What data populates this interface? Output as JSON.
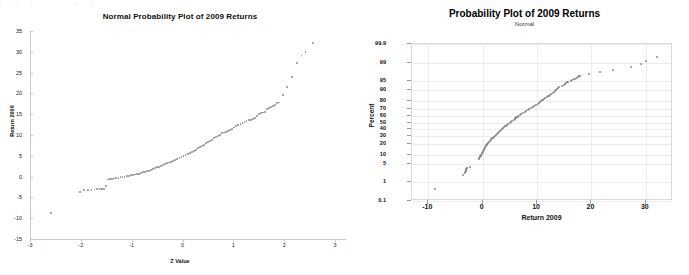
{
  "left_chart": {
    "title": "Normal Probability Plot of 2009 Returns",
    "xlabel": "Z Value",
    "ylabel": "Return 2009"
  },
  "right_chart": {
    "title": "Probability Plot of 2009 Returns",
    "subtitle": "Normal",
    "xlabel": "Return 2009",
    "ylabel": "Percent"
  },
  "artifact": {
    "text": "| | | , , | |"
  },
  "chart_data": [
    {
      "type": "scatter",
      "title": "Normal Probability Plot of 2009 Returns",
      "subtitle": "",
      "xlabel": "Z Value",
      "ylabel": "Return 2009",
      "xlim": [
        -3,
        3
      ],
      "ylim": [
        -15,
        35
      ],
      "xticks": [
        -3,
        -2,
        -1,
        0,
        1,
        2,
        3
      ],
      "yticks": [
        -15,
        -10,
        -5,
        0,
        5,
        10,
        15,
        20,
        25,
        30,
        35
      ],
      "grid": false,
      "legend": null,
      "marker_color": "#8a8a8a",
      "points": [
        [
          -2.58,
          -8.8
        ],
        [
          -2.02,
          -3.6
        ],
        [
          -1.93,
          -3.3
        ],
        [
          -1.86,
          -3.2
        ],
        [
          -1.79,
          -3.15
        ],
        [
          -1.73,
          -3.1
        ],
        [
          -1.68,
          -3.05
        ],
        [
          -1.63,
          -3.0
        ],
        [
          -1.58,
          -2.95
        ],
        [
          -1.54,
          -2.9
        ],
        [
          -1.5,
          -2.3
        ],
        [
          -1.46,
          -0.7
        ],
        [
          -1.42,
          -0.6
        ],
        [
          -1.38,
          -0.5
        ],
        [
          -1.34,
          -0.45
        ],
        [
          -1.3,
          -0.4
        ],
        [
          -1.26,
          -0.3
        ],
        [
          -1.22,
          -0.2
        ],
        [
          -1.18,
          -0.1
        ],
        [
          -1.14,
          0.0
        ],
        [
          -1.1,
          0.1
        ],
        [
          -1.06,
          0.2
        ],
        [
          -1.02,
          0.3
        ],
        [
          -0.98,
          0.4
        ],
        [
          -0.94,
          0.5
        ],
        [
          -0.9,
          0.6
        ],
        [
          -0.86,
          0.7
        ],
        [
          -0.82,
          0.85
        ],
        [
          -0.78,
          1.0
        ],
        [
          -0.74,
          1.15
        ],
        [
          -0.7,
          1.3
        ],
        [
          -0.66,
          1.45
        ],
        [
          -0.62,
          1.6
        ],
        [
          -0.58,
          1.8
        ],
        [
          -0.54,
          2.0
        ],
        [
          -0.5,
          2.2
        ],
        [
          -0.46,
          2.4
        ],
        [
          -0.42,
          2.6
        ],
        [
          -0.38,
          2.8
        ],
        [
          -0.34,
          3.0
        ],
        [
          -0.3,
          3.2
        ],
        [
          -0.26,
          3.4
        ],
        [
          -0.22,
          3.6
        ],
        [
          -0.18,
          3.8
        ],
        [
          -0.14,
          4.0
        ],
        [
          -0.1,
          4.2
        ],
        [
          -0.06,
          4.45
        ],
        [
          -0.02,
          4.7
        ],
        [
          0.02,
          4.95
        ],
        [
          0.06,
          5.2
        ],
        [
          0.1,
          5.45
        ],
        [
          0.14,
          5.7
        ],
        [
          0.18,
          5.95
        ],
        [
          0.22,
          6.2
        ],
        [
          0.26,
          6.5
        ],
        [
          0.3,
          6.8
        ],
        [
          0.34,
          7.1
        ],
        [
          0.38,
          7.4
        ],
        [
          0.42,
          7.7
        ],
        [
          0.46,
          8.0
        ],
        [
          0.5,
          8.3
        ],
        [
          0.54,
          8.6
        ],
        [
          0.58,
          8.9
        ],
        [
          0.62,
          9.2
        ],
        [
          0.66,
          9.5
        ],
        [
          0.7,
          9.8
        ],
        [
          0.74,
          10.1
        ],
        [
          0.78,
          10.4
        ],
        [
          0.82,
          10.6
        ],
        [
          0.86,
          10.8
        ],
        [
          0.9,
          11.0
        ],
        [
          0.94,
          11.2
        ],
        [
          0.98,
          11.5
        ],
        [
          1.02,
          11.8
        ],
        [
          1.06,
          12.1
        ],
        [
          1.1,
          12.35
        ],
        [
          1.14,
          12.6
        ],
        [
          1.18,
          12.85
        ],
        [
          1.22,
          13.1
        ],
        [
          1.26,
          13.3
        ],
        [
          1.3,
          13.5
        ],
        [
          1.34,
          13.7
        ],
        [
          1.38,
          13.9
        ],
        [
          1.42,
          14.1
        ],
        [
          1.46,
          14.6
        ],
        [
          1.5,
          15.0
        ],
        [
          1.54,
          15.2
        ],
        [
          1.58,
          15.4
        ],
        [
          1.62,
          15.6
        ],
        [
          1.66,
          16.2
        ],
        [
          1.7,
          16.5
        ],
        [
          1.74,
          16.8
        ],
        [
          1.78,
          17.0
        ],
        [
          1.82,
          17.3
        ],
        [
          1.86,
          17.6
        ],
        [
          1.9,
          17.8
        ],
        [
          1.98,
          19.6
        ],
        [
          2.06,
          21.6
        ],
        [
          2.15,
          23.9
        ],
        [
          2.26,
          27.2
        ],
        [
          2.34,
          29.1
        ],
        [
          2.42,
          30.0
        ],
        [
          2.56,
          32.1
        ]
      ]
    },
    {
      "type": "scatter",
      "title": "Probability Plot of 2009 Returns",
      "subtitle": "Normal",
      "xlabel": "Return 2009",
      "ylabel": "Percent",
      "xlim": [
        -13,
        35
      ],
      "ylim_percent": [
        0.1,
        99.9
      ],
      "yscale": "normal-probability",
      "xticks": [
        -10,
        0,
        10,
        20,
        30
      ],
      "yticks": [
        0.1,
        1,
        5,
        10,
        20,
        30,
        40,
        50,
        60,
        70,
        80,
        90,
        95,
        99,
        99.9
      ],
      "ytick_labels": [
        "0.1",
        "1",
        "5",
        "10",
        "20",
        "30",
        "40",
        "50",
        "60",
        "70",
        "80",
        "90",
        "95",
        "99",
        "99.9"
      ],
      "grid": true,
      "legend": null,
      "marker_color": "#8a8a8a",
      "points": [
        [
          -8.8,
          0.45
        ],
        [
          -3.6,
          1.9
        ],
        [
          -3.3,
          2.4
        ],
        [
          -3.2,
          2.6
        ],
        [
          -3.15,
          2.8
        ],
        [
          -3.1,
          3.0
        ],
        [
          -3.05,
          3.2
        ],
        [
          -3.0,
          3.4
        ],
        [
          -2.95,
          3.6
        ],
        [
          -2.9,
          3.8
        ],
        [
          -2.3,
          4.1
        ],
        [
          -0.7,
          7.5
        ],
        [
          -0.6,
          8.0
        ],
        [
          -0.5,
          8.5
        ],
        [
          -0.45,
          9.0
        ],
        [
          -0.4,
          9.5
        ],
        [
          -0.3,
          10.2
        ],
        [
          -0.2,
          11.0
        ],
        [
          -0.1,
          11.8
        ],
        [
          0.0,
          12.6
        ],
        [
          0.1,
          13.4
        ],
        [
          0.2,
          14.3
        ],
        [
          0.3,
          15.2
        ],
        [
          0.4,
          16.1
        ],
        [
          0.5,
          17.0
        ],
        [
          0.6,
          18.0
        ],
        [
          0.7,
          19.0
        ],
        [
          0.85,
          20.1
        ],
        [
          1.0,
          21.3
        ],
        [
          1.15,
          22.5
        ],
        [
          1.3,
          23.7
        ],
        [
          1.45,
          25.0
        ],
        [
          1.6,
          26.3
        ],
        [
          1.8,
          27.6
        ],
        [
          2.0,
          28.9
        ],
        [
          2.2,
          30.3
        ],
        [
          2.4,
          31.7
        ],
        [
          2.6,
          33.1
        ],
        [
          2.8,
          34.5
        ],
        [
          3.0,
          35.9
        ],
        [
          3.2,
          37.4
        ],
        [
          3.4,
          38.9
        ],
        [
          3.6,
          40.4
        ],
        [
          3.8,
          41.9
        ],
        [
          4.0,
          43.4
        ],
        [
          4.2,
          45.0
        ],
        [
          4.45,
          46.6
        ],
        [
          4.7,
          48.2
        ],
        [
          4.95,
          49.8
        ],
        [
          5.2,
          51.4
        ],
        [
          5.45,
          53.0
        ],
        [
          5.7,
          54.6
        ],
        [
          5.95,
          56.2
        ],
        [
          6.2,
          57.8
        ],
        [
          6.5,
          59.4
        ],
        [
          6.8,
          61.0
        ],
        [
          7.1,
          62.6
        ],
        [
          7.4,
          64.2
        ],
        [
          7.7,
          65.7
        ],
        [
          8.0,
          67.2
        ],
        [
          8.3,
          68.7
        ],
        [
          8.6,
          70.2
        ],
        [
          8.9,
          71.6
        ],
        [
          9.2,
          73.0
        ],
        [
          9.5,
          74.4
        ],
        [
          9.8,
          75.7
        ],
        [
          10.1,
          77.0
        ],
        [
          10.4,
          78.2
        ],
        [
          10.6,
          79.4
        ],
        [
          10.8,
          80.5
        ],
        [
          11.0,
          81.6
        ],
        [
          11.2,
          82.6
        ],
        [
          11.5,
          83.6
        ],
        [
          11.8,
          84.6
        ],
        [
          12.1,
          85.5
        ],
        [
          12.35,
          86.4
        ],
        [
          12.6,
          87.2
        ],
        [
          12.85,
          88.0
        ],
        [
          13.1,
          88.8
        ],
        [
          13.3,
          89.5
        ],
        [
          13.5,
          90.2
        ],
        [
          13.7,
          90.8
        ],
        [
          13.9,
          91.4
        ],
        [
          14.1,
          92.0
        ],
        [
          14.6,
          92.6
        ],
        [
          15.0,
          93.1
        ],
        [
          15.2,
          93.6
        ],
        [
          15.4,
          94.0
        ],
        [
          15.6,
          94.4
        ],
        [
          16.2,
          94.8
        ],
        [
          16.5,
          95.2
        ],
        [
          16.8,
          95.5
        ],
        [
          17.0,
          95.8
        ],
        [
          17.3,
          96.1
        ],
        [
          17.6,
          96.4
        ],
        [
          17.8,
          96.6
        ],
        [
          19.6,
          97.2
        ],
        [
          21.6,
          97.7
        ],
        [
          23.9,
          98.1
        ],
        [
          27.2,
          98.5
        ],
        [
          29.1,
          98.9
        ],
        [
          30.0,
          99.2
        ],
        [
          32.1,
          99.5
        ]
      ]
    }
  ]
}
